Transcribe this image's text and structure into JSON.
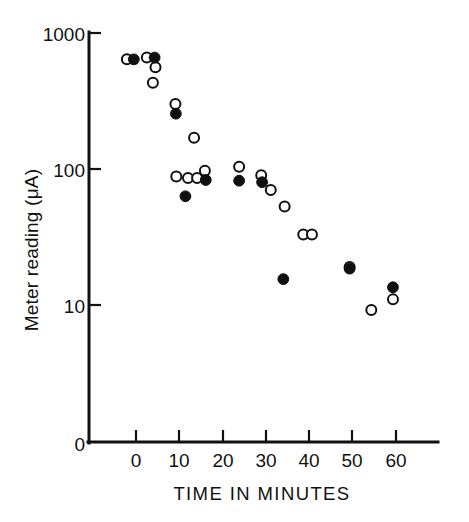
{
  "figure": {
    "background_color": "#ffffff",
    "ink_color": "#111111",
    "width": 469,
    "height": 522
  },
  "chart_data": {
    "type": "scatter",
    "title": "",
    "xlabel": "TIME IN MINUTES",
    "ylabel": "Meter reading (μA)",
    "y_scale": "log",
    "y_tick_labels": [
      "1000",
      "100",
      "10",
      "0"
    ],
    "y_tick_values": [
      1000,
      100,
      10,
      0
    ],
    "ylim": [
      10,
      1000
    ],
    "y_axis_broken_below": true,
    "x_scale": "linear",
    "x_tick_labels": [
      "0",
      "10",
      "20",
      "30",
      "40",
      "50",
      "60"
    ],
    "x_tick_values": [
      0,
      10,
      20,
      30,
      40,
      50,
      60
    ],
    "xlim": [
      -3,
      68
    ],
    "grid": false,
    "legend": "none",
    "series": [
      {
        "name": "open-circles",
        "marker": "open circle",
        "marker_fill": "#ffffff",
        "marker_edge": "#101010",
        "points": [
          {
            "x": -2.1,
            "y": 640
          },
          {
            "x": 2.5,
            "y": 660
          },
          {
            "x": 4.5,
            "y": 560
          },
          {
            "x": 3.9,
            "y": 430
          },
          {
            "x": 9.1,
            "y": 300
          },
          {
            "x": 13.4,
            "y": 170
          },
          {
            "x": 9.3,
            "y": 88
          },
          {
            "x": 12.0,
            "y": 86
          },
          {
            "x": 14.1,
            "y": 86
          },
          {
            "x": 15.9,
            "y": 97
          },
          {
            "x": 23.8,
            "y": 104
          },
          {
            "x": 28.9,
            "y": 90
          },
          {
            "x": 31.1,
            "y": 70
          },
          {
            "x": 34.3,
            "y": 53
          },
          {
            "x": 38.6,
            "y": 33
          },
          {
            "x": 40.6,
            "y": 33
          },
          {
            "x": 49.3,
            "y": 19
          },
          {
            "x": 54.3,
            "y": 9.2
          },
          {
            "x": 59.3,
            "y": 11.0
          }
        ]
      },
      {
        "name": "filled-circles",
        "marker": "filled circle",
        "marker_fill": "#101010",
        "marker_edge": "#101010",
        "points": [
          {
            "x": -0.5,
            "y": 640
          },
          {
            "x": 4.3,
            "y": 660
          },
          {
            "x": 9.2,
            "y": 255
          },
          {
            "x": 11.4,
            "y": 63
          },
          {
            "x": 16.1,
            "y": 83
          },
          {
            "x": 23.8,
            "y": 82
          },
          {
            "x": 29.1,
            "y": 80
          },
          {
            "x": 34.0,
            "y": 15.5
          },
          {
            "x": 49.3,
            "y": 18.5
          },
          {
            "x": 59.3,
            "y": 13.5
          }
        ]
      }
    ]
  }
}
